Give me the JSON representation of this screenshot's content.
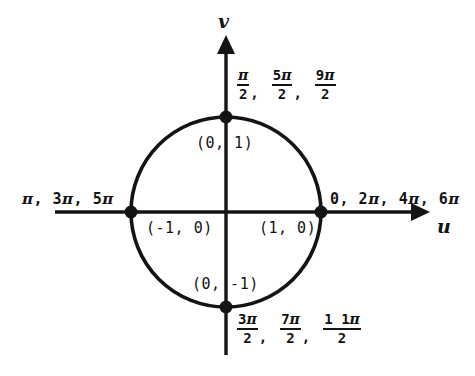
{
  "figure": {
    "background_color": "#ffffff",
    "stroke_color": "#141414",
    "axes": {
      "horizontal_label": "u",
      "vertical_label": "v"
    },
    "circle": {
      "center_u": 226,
      "center_v": 212,
      "radius_px": 95,
      "radius_units": 1
    },
    "points": [
      {
        "name": "right-point",
        "label": "(1, 0)",
        "u": 1,
        "v": 0
      },
      {
        "name": "top-point",
        "label": "(0, 1)",
        "u": 0,
        "v": 1
      },
      {
        "name": "left-point",
        "label": "(-1, 0)",
        "u": -1,
        "v": 0
      },
      {
        "name": "bottom-point",
        "label": "(0, -1)",
        "u": 0,
        "v": -1
      }
    ],
    "angle_labels": {
      "right": {
        "text": "0, 2π, 4π, 6π",
        "values": [
          "0",
          "2π",
          "4π",
          "6π"
        ]
      },
      "left": {
        "text": "π, 3π, 5π",
        "values": [
          "π",
          "3π",
          "5π"
        ]
      },
      "top": {
        "values": [
          {
            "numerator": "π",
            "denominator": "2",
            "trailing": ","
          },
          {
            "numerator": "5π",
            "denominator": "2",
            "trailing": ","
          },
          {
            "numerator": "9π",
            "denominator": "2",
            "trailing": ""
          }
        ]
      },
      "bottom": {
        "values": [
          {
            "numerator": "3π",
            "denominator": "2",
            "trailing": ","
          },
          {
            "numerator": "7π",
            "denominator": "2",
            "trailing": ","
          },
          {
            "numerator": "1 1π",
            "denominator": "2",
            "trailing": ""
          }
        ]
      }
    }
  },
  "chart_data": {
    "type": "scatter",
    "xlabel": "u",
    "ylabel": "v",
    "xlim": [
      -2.1,
      2.1
    ],
    "ylim": [
      -2.0,
      1.85
    ],
    "grid": false,
    "legend": "none",
    "series": [
      {
        "name": "unit circle",
        "kind": "circle",
        "center": [
          0,
          0
        ],
        "radius": 1
      },
      {
        "name": "axis intercepts",
        "kind": "points",
        "x": [
          1,
          0,
          -1,
          0
        ],
        "y": [
          0,
          1,
          0,
          -1
        ],
        "labels": [
          "(1, 0)",
          "(0, 1)",
          "(-1, 0)",
          "(0, -1)"
        ]
      }
    ],
    "annotations": [
      {
        "at": [
          1,
          0
        ],
        "text": "0, 2π, 4π, 6π",
        "position": "right"
      },
      {
        "at": [
          -1,
          0
        ],
        "text": "π, 3π, 5π",
        "position": "left"
      },
      {
        "at": [
          0,
          1
        ],
        "text": "π/2, 5π/2, 9π/2",
        "position": "upper-right"
      },
      {
        "at": [
          0,
          -1
        ],
        "text": "3π/2, 7π/2, 11π/2",
        "position": "lower-right"
      }
    ]
  }
}
